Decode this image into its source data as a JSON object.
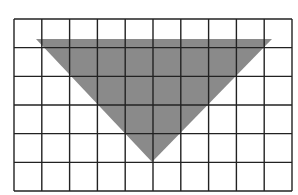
{
  "figure": {
    "grid": {
      "columns": 10,
      "rows": 6,
      "left": 14,
      "top": 19,
      "right": 292,
      "bottom": 191,
      "line_color": "#222222",
      "background": "#ffffff"
    },
    "triangle": {
      "fill": "#8a8a8a",
      "vertices": [
        [
          36,
          39
        ],
        [
          272,
          39
        ],
        [
          152,
          162
        ]
      ]
    }
  }
}
